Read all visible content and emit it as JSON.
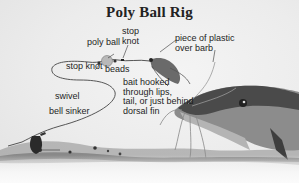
{
  "diagram": {
    "title": "Poly Ball Rig",
    "labels": {
      "poly_ball": "poly ball",
      "stop_knot_top": "stop\nknot",
      "piece_of_plastic": "piece of plastic\nover barb",
      "stop_knot_left": "stop knot",
      "beads": "beads",
      "bait": "bait hooked\nthrough lips,\ntail, or just behind\ndorsal fin",
      "swivel": "swivel",
      "bell_sinker": "bell sinker"
    },
    "colors": {
      "ink": "#1e1e1e",
      "poly_ball": "#b8b8b8",
      "fish_dark": "#4a4a4a",
      "fish_light": "#9a9a9a",
      "bottom": "#7a7a7a"
    }
  }
}
